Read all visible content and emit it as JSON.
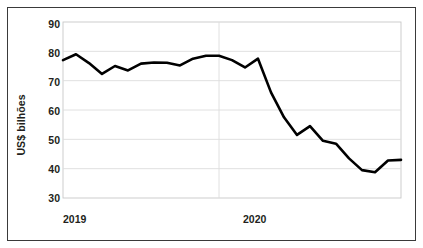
{
  "chart_data": {
    "type": "line",
    "title": "",
    "xlabel": "",
    "ylabel": "US$ bilhões",
    "ylim": [
      30,
      90
    ],
    "yticks": [
      30,
      40,
      50,
      60,
      70,
      80,
      90
    ],
    "ytick_labels": [
      "30",
      "40",
      "50",
      "60",
      "70",
      "80",
      "90"
    ],
    "xtick_labels": [
      "2019",
      "2020"
    ],
    "xticks_index": [
      0,
      12
    ],
    "grid": true,
    "grid_axis": "both",
    "legend": false,
    "legend_position": "none",
    "line_color": "#000000",
    "line_width": 2.6,
    "categories": [
      "2019-01",
      "2019-02",
      "2019-03",
      "2019-04",
      "2019-05",
      "2019-06",
      "2019-07",
      "2019-08",
      "2019-09",
      "2019-10",
      "2019-11",
      "2019-12",
      "2020-01",
      "2020-02",
      "2020-03",
      "2020-04",
      "2020-05",
      "2020-06",
      "2020-07",
      "2020-08",
      "2020-09",
      "2020-10",
      "2020-11",
      "2020-12"
    ],
    "series": [
      {
        "name": "US$ bilhões",
        "values": [
          77.0,
          79.0,
          76.0,
          72.3,
          75.0,
          73.5,
          75.8,
          76.2,
          76.1,
          75.2,
          77.5,
          78.5,
          78.5,
          77.0,
          74.5,
          77.5,
          66.0,
          57.5,
          51.5,
          54.5,
          49.5,
          48.5,
          43.5,
          39.5
        ]
      }
    ],
    "values": [
      77.0,
      79.0,
      76.0,
      72.3,
      75.0,
      73.5,
      75.8,
      76.2,
      76.1,
      75.2,
      77.5,
      78.5,
      78.5,
      77.0,
      74.5,
      77.5,
      66.0,
      57.5,
      51.5,
      54.5,
      49.5,
      48.5,
      43.5,
      39.5
    ],
    "extra_values_tail": [
      38.8,
      42.8,
      43.0
    ],
    "annotations": []
  },
  "axes": {
    "y_axis_title": "US$ bilhões",
    "x_year_left": "2019",
    "x_year_right": "2020"
  },
  "colors": {
    "line": "#000000",
    "grid": "#dcdcdc",
    "frame": "#3a3a3a",
    "plot_border": "#c8c8c8",
    "text": "#231f20",
    "background": "#ffffff"
  }
}
